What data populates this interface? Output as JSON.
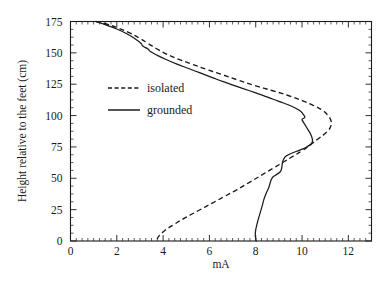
{
  "chart_data": {
    "type": "line",
    "title": "",
    "subtitle": "",
    "xlabel": "mA",
    "ylabel": "Height relative to the feet (cm)",
    "xlim": [
      0,
      13
    ],
    "ylim": [
      0,
      175
    ],
    "grid": false,
    "orientation": "x is value, y is height",
    "xticks": [
      0,
      2,
      4,
      6,
      8,
      10,
      12
    ],
    "xticklabels": [
      "0",
      "2",
      "4",
      "6",
      "8",
      "10",
      "12"
    ],
    "x_minor_tick_step": 0.25,
    "yticks": [
      0,
      25,
      50,
      75,
      100,
      125,
      150,
      175
    ],
    "yticklabels": [
      "0",
      "25",
      "50",
      "75",
      "100",
      "125",
      "150",
      "175"
    ],
    "y_minor_tick_step": 6.25,
    "legend_position": "upper left inside axes",
    "legend": [
      "isolated",
      "grounded"
    ],
    "series": [
      {
        "name": "isolated",
        "style": "dashed",
        "color": "#1a1a1a",
        "points": [
          [
            1.1,
            175.0
          ],
          [
            1.55,
            173.0
          ],
          [
            2.1,
            169.5
          ],
          [
            2.6,
            165.5
          ],
          [
            3.0,
            161.5
          ],
          [
            3.35,
            157.5
          ],
          [
            3.7,
            153.5
          ],
          [
            4.15,
            149.0
          ],
          [
            4.65,
            145.0
          ],
          [
            5.25,
            141.0
          ],
          [
            5.85,
            137.0
          ],
          [
            6.5,
            133.0
          ],
          [
            7.2,
            128.5
          ],
          [
            7.95,
            124.0
          ],
          [
            8.7,
            120.0
          ],
          [
            9.4,
            116.0
          ],
          [
            10.0,
            112.0
          ],
          [
            10.5,
            108.0
          ],
          [
            10.9,
            104.0
          ],
          [
            11.12,
            100.0
          ],
          [
            11.25,
            96.0
          ],
          [
            11.25,
            92.0
          ],
          [
            11.15,
            88.5
          ],
          [
            10.95,
            85.0
          ],
          [
            10.7,
            81.5
          ],
          [
            10.45,
            78.0
          ],
          [
            10.25,
            75.0
          ],
          [
            10.0,
            72.0
          ],
          [
            9.65,
            68.0
          ],
          [
            9.2,
            63.0
          ],
          [
            8.75,
            58.0
          ],
          [
            8.25,
            52.5
          ],
          [
            7.75,
            47.0
          ],
          [
            7.2,
            41.0
          ],
          [
            6.65,
            35.5
          ],
          [
            6.1,
            30.0
          ],
          [
            5.55,
            24.5
          ],
          [
            5.0,
            19.0
          ],
          [
            4.5,
            13.5
          ],
          [
            4.05,
            8.0
          ],
          [
            3.8,
            3.5
          ],
          [
            3.75,
            1.5
          ]
        ]
      },
      {
        "name": "grounded",
        "style": "solid",
        "color": "#1a1a1a",
        "points": [
          [
            1.1,
            175.0
          ],
          [
            1.5,
            172.5
          ],
          [
            2.0,
            169.0
          ],
          [
            2.45,
            165.0
          ],
          [
            2.8,
            161.0
          ],
          [
            3.05,
            157.5
          ],
          [
            3.12,
            155.5
          ],
          [
            3.35,
            153.0
          ],
          [
            3.45,
            151.0
          ],
          [
            3.75,
            148.0
          ],
          [
            4.15,
            144.5
          ],
          [
            4.6,
            141.0
          ],
          [
            5.1,
            137.5
          ],
          [
            5.6,
            134.0
          ],
          [
            6.1,
            130.5
          ],
          [
            6.6,
            127.0
          ],
          [
            7.15,
            123.5
          ],
          [
            7.7,
            120.0
          ],
          [
            8.25,
            116.5
          ],
          [
            8.75,
            113.0
          ],
          [
            9.2,
            110.0
          ],
          [
            9.6,
            107.0
          ],
          [
            9.9,
            104.0
          ],
          [
            10.05,
            101.0
          ],
          [
            10.12,
            98.5
          ],
          [
            10.0,
            97.0
          ],
          [
            10.05,
            95.0
          ],
          [
            10.15,
            92.0
          ],
          [
            10.25,
            89.0
          ],
          [
            10.35,
            86.0
          ],
          [
            10.42,
            83.0
          ],
          [
            10.45,
            80.0
          ],
          [
            10.4,
            77.5
          ],
          [
            10.2,
            75.0
          ],
          [
            9.9,
            72.5
          ],
          [
            9.55,
            70.0
          ],
          [
            9.3,
            67.5
          ],
          [
            9.2,
            65.0
          ],
          [
            9.15,
            62.0
          ],
          [
            9.12,
            58.0
          ],
          [
            9.05,
            55.0
          ],
          [
            8.85,
            52.5
          ],
          [
            8.7,
            50.0
          ],
          [
            8.62,
            46.0
          ],
          [
            8.55,
            42.0
          ],
          [
            8.45,
            38.0
          ],
          [
            8.35,
            33.0
          ],
          [
            8.28,
            28.0
          ],
          [
            8.2,
            23.0
          ],
          [
            8.12,
            18.0
          ],
          [
            8.05,
            13.0
          ],
          [
            8.0,
            9.0
          ],
          [
            7.98,
            5.0
          ],
          [
            8.0,
            2.0
          ],
          [
            8.02,
            0.0
          ]
        ]
      }
    ]
  },
  "axes": {
    "x_axis_title": "mA",
    "y_axis_title": "Height relative to the feet (cm)"
  },
  "legend": {
    "entries": [
      {
        "label": "isolated",
        "style": "dashed"
      },
      {
        "label": "grounded",
        "style": "solid"
      }
    ]
  }
}
